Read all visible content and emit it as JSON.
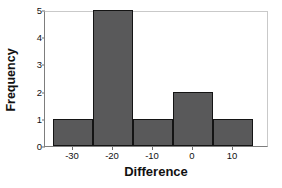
{
  "chart_data": {
    "type": "bar",
    "title": "",
    "xlabel": "Difference",
    "ylabel": "Frequency",
    "bin_width": 10,
    "bin_edges": [
      -35,
      -25,
      -15,
      -5,
      5,
      15
    ],
    "categories": [
      "-35 to -25",
      "-25 to -15",
      "-15 to -5",
      "-5 to 5",
      "5 to 15"
    ],
    "values": [
      1,
      5,
      1,
      2,
      1
    ],
    "x_tick_labels": [
      "-30",
      "-20",
      "-10",
      "0",
      "10"
    ],
    "x_tick_values": [
      -30,
      -20,
      -10,
      0,
      10
    ],
    "y_tick_labels": [
      "0",
      "1",
      "2",
      "3",
      "4",
      "5"
    ],
    "y_tick_values": [
      0,
      1,
      2,
      3,
      4,
      5
    ],
    "xlim": [
      -37,
      19
    ],
    "ylim": [
      0,
      5
    ],
    "grid": false,
    "legend": null,
    "bar_fill_color": "#59595a",
    "bar_edge_color": "#141414",
    "axis_color": "#7d7d7d",
    "text_color": "#111111",
    "background_color": "#ffffff"
  }
}
